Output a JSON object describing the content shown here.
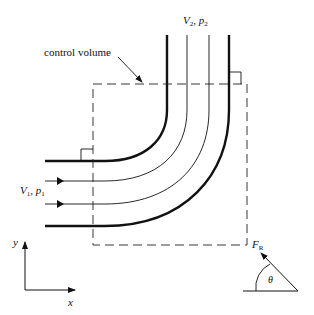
{
  "labels": {
    "control_volume": "control volume",
    "outlet_V": "V",
    "outlet_V_sub": "2",
    "outlet_sep": ", ",
    "outlet_p": "p",
    "outlet_p_sub": "2",
    "inlet_V": "V",
    "inlet_V_sub": "1",
    "inlet_sep": ", ",
    "inlet_p": "p",
    "inlet_p_sub": "1",
    "force_F": "F",
    "force_sub": "R",
    "angle": "θ",
    "axis_x": "x",
    "axis_y": "y"
  },
  "colors": {
    "stroke": "#111111",
    "background": "#ffffff"
  }
}
